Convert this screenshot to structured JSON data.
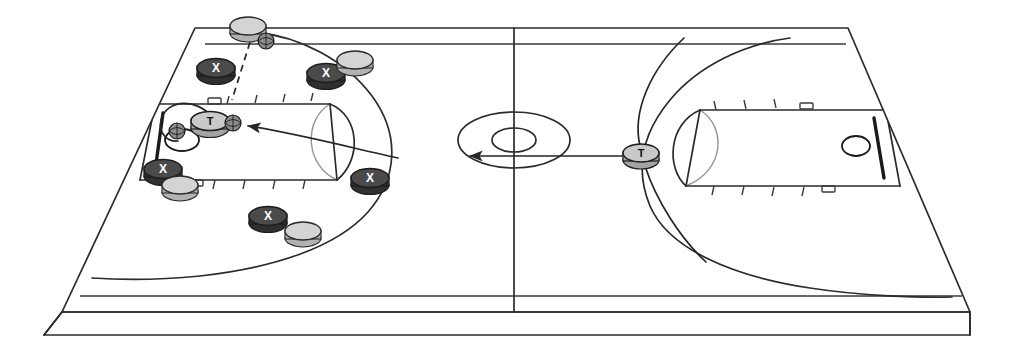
{
  "diagram": {
    "court_surface_color": "#ffffff",
    "line_color": "#2b2b2b",
    "defender_chip_color": "#4a4a4a",
    "offense_chip_color": "#d4d4d4",
    "coach_chip_color": "#c9c9c9",
    "ball_color": "#8c8c8c"
  },
  "court": {
    "name": "full-court-3d",
    "halves": [
      {
        "name": "left-half",
        "label": ""
      },
      {
        "name": "right-half",
        "label": ""
      }
    ],
    "features": [
      "center-circle",
      "center-inner-circle",
      "half-court-line",
      "left-key",
      "right-key",
      "left-three-point-arc",
      "right-three-point-arc",
      "left-backboard",
      "left-rim",
      "right-backboard",
      "right-rim",
      "lane-hash-marks",
      "court-3d-edge"
    ]
  },
  "markers": {
    "defenders": [
      {
        "name": "defender-1",
        "label": "X",
        "x": 216,
        "y": 71
      },
      {
        "name": "defender-2",
        "label": "X",
        "x": 326,
        "y": 76
      },
      {
        "name": "defender-3",
        "label": "X",
        "x": 163,
        "y": 172
      },
      {
        "name": "defender-4",
        "label": "X",
        "x": 370,
        "y": 180
      },
      {
        "name": "defender-5",
        "label": "X",
        "x": 268,
        "y": 219
      }
    ],
    "offense": [
      {
        "name": "offense-1",
        "x": 248,
        "y": 29
      },
      {
        "name": "offense-2",
        "x": 355,
        "y": 63
      },
      {
        "name": "offense-3",
        "x": 180,
        "y": 188
      },
      {
        "name": "offense-4",
        "x": 303,
        "y": 234
      }
    ],
    "coaches": [
      {
        "name": "coach-left-key",
        "label": "T",
        "x": 210,
        "y": 124
      },
      {
        "name": "coach-right-wing",
        "label": "T",
        "x": 641,
        "y": 155
      }
    ],
    "balls": [
      {
        "name": "ball-top-inbound",
        "x": 266,
        "y": 41
      },
      {
        "name": "ball-at-coach",
        "x": 233,
        "y": 123
      },
      {
        "name": "ball-at-left-rim",
        "x": 177,
        "y": 131
      }
    ]
  },
  "routes": [
    {
      "name": "pass-arrow-to-coach",
      "type": "arrow",
      "style": "solid",
      "from": "coach-right-wing",
      "to": "ball-at-coach"
    },
    {
      "name": "inbound-dashed-path",
      "type": "line",
      "style": "dashed",
      "from": "offense-1",
      "to": "left-free-throw-line"
    },
    {
      "name": "shot-arc-left-basket",
      "type": "curve",
      "style": "solid",
      "from": "coach-left-key",
      "to": "left-rim"
    },
    {
      "name": "right-half-cut-upper",
      "type": "curve",
      "style": "solid",
      "from": "coach-right-wing",
      "to": "right-baseline-upper"
    },
    {
      "name": "right-half-cut-lower",
      "type": "curve",
      "style": "solid",
      "from": "coach-right-wing",
      "to": "right-baseline-lower"
    }
  ]
}
